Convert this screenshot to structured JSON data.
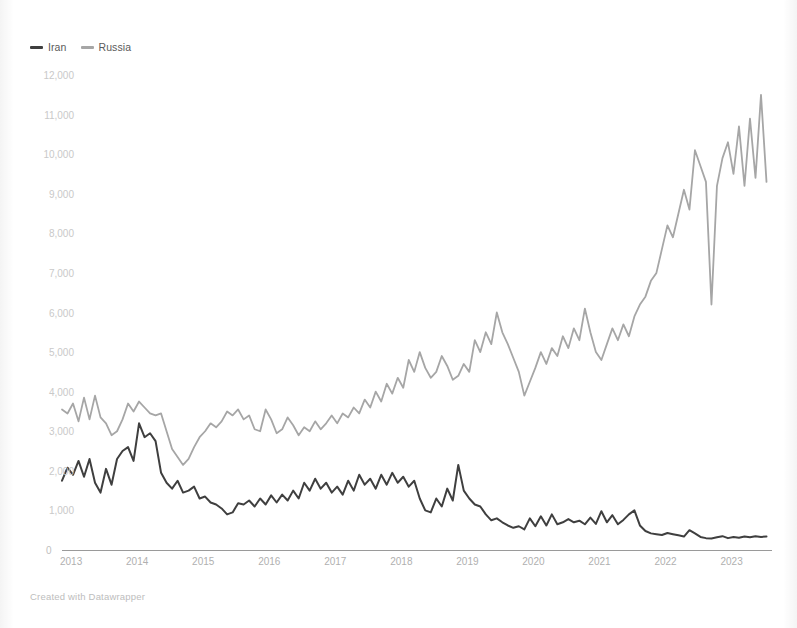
{
  "footer": {
    "credit": "Created with Datawrapper"
  },
  "legend": {
    "position": "top-left",
    "items": [
      {
        "label": "Iran",
        "color": "#3f3f3f",
        "icon": "line-swatch-icon"
      },
      {
        "label": "Russia",
        "color": "#a6a6a6",
        "icon": "line-swatch-icon"
      }
    ]
  },
  "chart_data": {
    "type": "line",
    "title": "",
    "subtitle": "",
    "xlabel": "",
    "ylabel": "",
    "grid": false,
    "legend_position": "top-left",
    "xlim": [
      2013.0,
      2023.75
    ],
    "ylim": [
      0,
      12000
    ],
    "y_ticks": [
      0,
      1000,
      2000,
      3000,
      4000,
      5000,
      6000,
      7000,
      8000,
      9000,
      10000,
      11000,
      12000
    ],
    "y_tick_labels": [
      "0",
      "1,000",
      "2,000",
      "3,000",
      "4,000",
      "5,000",
      "6,000",
      "7,000",
      "8,000",
      "9,000",
      "10,000",
      "11,000",
      "12,000"
    ],
    "x_ticks": [
      2013,
      2014,
      2015,
      2016,
      2017,
      2018,
      2019,
      2020,
      2021,
      2022,
      2023
    ],
    "x_tick_labels": [
      "2013",
      "2014",
      "2015",
      "2016",
      "2017",
      "2018",
      "2019",
      "2020",
      "2021",
      "2022",
      "2023"
    ],
    "x_step_months": 1,
    "x_start": 2013.0,
    "series": [
      {
        "name": "Iran",
        "color": "#3f3f3f",
        "values": [
          1750,
          2080,
          1900,
          2250,
          1850,
          2300,
          1700,
          1450,
          2050,
          1650,
          2300,
          2500,
          2600,
          2250,
          3200,
          2850,
          2950,
          2750,
          1950,
          1700,
          1550,
          1750,
          1450,
          1500,
          1600,
          1300,
          1350,
          1200,
          1150,
          1050,
          900,
          950,
          1180,
          1150,
          1250,
          1100,
          1300,
          1150,
          1380,
          1200,
          1400,
          1250,
          1500,
          1300,
          1700,
          1500,
          1800,
          1550,
          1700,
          1450,
          1600,
          1400,
          1750,
          1500,
          1900,
          1650,
          1800,
          1550,
          1900,
          1650,
          1950,
          1700,
          1850,
          1600,
          1750,
          1300,
          1000,
          950,
          1300,
          1100,
          1550,
          1250,
          2150,
          1500,
          1300,
          1150,
          1100,
          900,
          750,
          800,
          700,
          620,
          560,
          600,
          520,
          800,
          600,
          850,
          620,
          900,
          650,
          700,
          780,
          700,
          740,
          650,
          820,
          660,
          980,
          700,
          880,
          650,
          760,
          900,
          1000,
          620,
          480,
          420,
          400,
          380,
          430,
          400,
          370,
          340,
          500,
          420,
          330,
          300,
          290,
          320,
          350,
          300,
          330,
          310,
          340,
          320,
          350,
          330,
          340
        ]
      },
      {
        "name": "Russia",
        "color": "#a6a6a6",
        "values": [
          3550,
          3450,
          3700,
          3250,
          3850,
          3300,
          3900,
          3350,
          3200,
          2900,
          3000,
          3300,
          3700,
          3500,
          3750,
          3600,
          3450,
          3400,
          3450,
          3000,
          2550,
          2350,
          2150,
          2300,
          2600,
          2850,
          3000,
          3200,
          3100,
          3250,
          3500,
          3400,
          3550,
          3300,
          3400,
          3050,
          3000,
          3550,
          3300,
          2950,
          3050,
          3350,
          3150,
          2900,
          3100,
          3000,
          3250,
          3050,
          3200,
          3400,
          3200,
          3450,
          3350,
          3600,
          3450,
          3800,
          3600,
          4000,
          3750,
          4200,
          3950,
          4350,
          4100,
          4800,
          4500,
          5000,
          4600,
          4350,
          4500,
          4900,
          4650,
          4300,
          4400,
          4700,
          4500,
          5300,
          5000,
          5500,
          5200,
          6000,
          5500,
          5200,
          4850,
          4500,
          3900,
          4250,
          4600,
          5000,
          4700,
          5100,
          4900,
          5400,
          5100,
          5600,
          5300,
          6100,
          5500,
          5000,
          4800,
          5200,
          5600,
          5300,
          5700,
          5400,
          5900,
          6200,
          6400,
          6800,
          7000,
          7600,
          8200,
          7900,
          8500,
          9100,
          8600,
          10100,
          9700,
          9300,
          6200,
          9200,
          9900,
          10300,
          9500,
          10700,
          9200,
          10900,
          9400,
          11500,
          9300
        ]
      }
    ]
  }
}
